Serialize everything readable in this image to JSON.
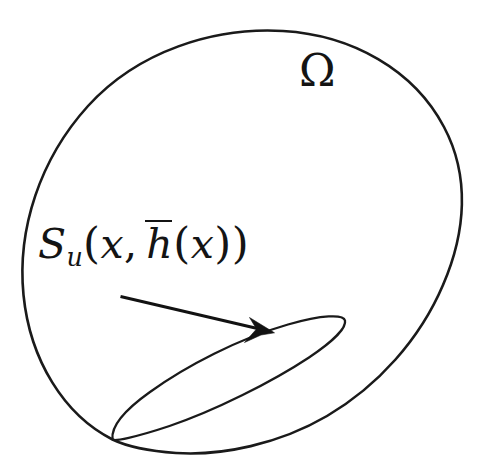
{
  "figure": {
    "background_color": "#ffffff",
    "stroke_color": "#1a1a1a",
    "region": {
      "name": "omega-region",
      "label": "Ω",
      "label_position": {
        "x": 299,
        "y": 49
      },
      "description": "closed blob-shaped domain boundary"
    },
    "surface": {
      "name": "su-surface",
      "description": "slanted elliptical surface inside the domain, tangent to the lower boundary at its left tip",
      "tip_left": {
        "x": 112,
        "y": 438
      },
      "tip_right": {
        "x": 345,
        "y": 317
      }
    },
    "surface_label": {
      "parts": {
        "symbol": "S",
        "subscript": "u",
        "open_paren": "(",
        "arg1": "x",
        "comma": ",",
        "arg2_base": "h",
        "arg2_overbar": true,
        "arg2_open_paren": "(",
        "arg2_inner": "x",
        "arg2_close_paren": ")",
        "close_paren": ")"
      },
      "plain_text": "S_u(x, h̄(x))",
      "position": {
        "x": 38,
        "y": 222
      }
    },
    "arrow": {
      "name": "label-to-surface-arrow",
      "start": {
        "x": 120,
        "y": 297
      },
      "end": {
        "x": 268,
        "y": 331
      }
    }
  }
}
